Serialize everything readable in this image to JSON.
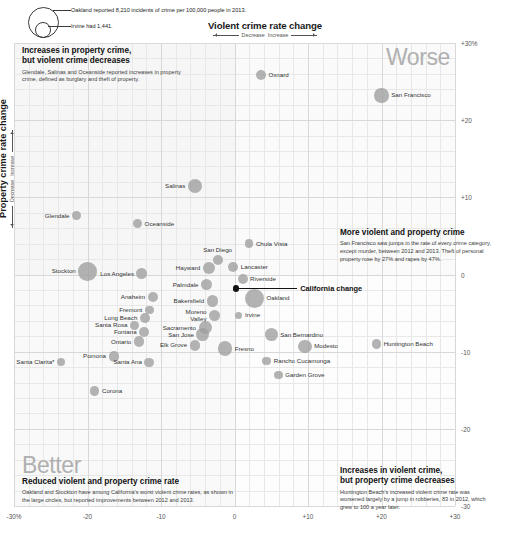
{
  "header": {
    "x_axis_title": "Violent crime rate change",
    "x_dir_left": "Decrease",
    "x_dir_right": "Increase",
    "y_axis_title": "Property crime rate change",
    "y_dir_up": "Increase",
    "y_dir_down": "Decrease"
  },
  "legend": {
    "line1": "Oakland reported 8,210 incidents of crime per 100,000 people in 2013.",
    "line2": "Irvine had 1,441."
  },
  "callout": {
    "label": "California change"
  },
  "corner_words": {
    "worse": "Worse",
    "better": "Better"
  },
  "annotations": [
    {
      "id": "top-left",
      "headline": "Increases in property crime,\nbut violent crime decreases",
      "headline_line1": "Increases in property crime,",
      "headline_line2": "but violent crime decreases",
      "body": "Glendale, Salinas and Oceanside reported increases in property crime, defined as burglary and theft of property."
    },
    {
      "id": "top-right",
      "headline_line1": "More violent and property crime",
      "headline_line2": "",
      "body": "San Francisco saw jumps in the rate of every crime category, except murder, between 2012 and 2013. Theft of personal property rose by 27% and rapes by 47%."
    },
    {
      "id": "bottom-left",
      "headline_line1": "Reduced violent and property crime rate",
      "headline_line2": "",
      "body": "Oakland and Stockton have among California's worst violent crime rates, as shown in the large circles, but reported improvements between 2012 and 2013."
    },
    {
      "id": "bottom-right",
      "headline_line1": "Increases in violent crime,",
      "headline_line2": "but property crime decreases",
      "body": "Huntington Beach's increased violent crime rate was worsened largely by a jump in robberies, 83 in 2012, which grew to 100 a year later."
    }
  ],
  "chart_data": {
    "type": "scatter",
    "xlabel": "Violent crime rate change",
    "ylabel": "Property crime rate change",
    "xlim": [
      -30,
      30
    ],
    "ylim": [
      -30,
      30
    ],
    "xticks": [
      "-30%",
      "-20",
      "-10",
      "0",
      "+10",
      "+20",
      "+30"
    ],
    "xtick_values": [
      -30,
      -20,
      -10,
      0,
      10,
      20,
      30
    ],
    "yticks": [
      "+30%",
      "+20",
      "+10",
      "0",
      "-10",
      "-20",
      "-30"
    ],
    "ytick_values": [
      30,
      20,
      10,
      0,
      -10,
      -20,
      -30
    ],
    "grid": true,
    "legend_position": "top-left",
    "size_encodes": "total crime incidents per 100,000 people in 2013",
    "points": [
      {
        "name": "Oxnard",
        "x": 3.6,
        "y": 25.8,
        "r": 5.0,
        "label_pos": "l"
      },
      {
        "name": "San Francisco",
        "x": 20.0,
        "y": 23.2,
        "r": 7.2,
        "label_pos": "l"
      },
      {
        "name": "Salinas",
        "x": -5.4,
        "y": 11.5,
        "r": 7.0,
        "label_pos": "r"
      },
      {
        "name": "Glendale",
        "x": -21.5,
        "y": 7.6,
        "r": 4.4,
        "label_pos": "r"
      },
      {
        "name": "Oceanside",
        "x": -13.2,
        "y": 6.6,
        "r": 4.6,
        "label_pos": "l"
      },
      {
        "name": "Chula Vista",
        "x": 2.0,
        "y": 4.0,
        "r": 4.2,
        "label_pos": "l"
      },
      {
        "name": "San Diego",
        "x": -2.3,
        "y": 1.9,
        "r": 5.0,
        "label_pos": "c_top"
      },
      {
        "name": "Hayward",
        "x": -3.5,
        "y": 0.9,
        "r": 6.0,
        "label_pos": "r"
      },
      {
        "name": "Lancaster",
        "x": -0.2,
        "y": 1.0,
        "r": 5.2,
        "label_pos": "l"
      },
      {
        "name": "Stockton",
        "x": -20.0,
        "y": 0.4,
        "r": 9.2,
        "label_pos": "r"
      },
      {
        "name": "Los Angeles",
        "x": -12.6,
        "y": 0.1,
        "r": 5.4,
        "label_pos": "r"
      },
      {
        "name": "Riverside",
        "x": 1.1,
        "y": -0.6,
        "r": 5.0,
        "label_pos": "l"
      },
      {
        "name": "Palmdale",
        "x": -3.8,
        "y": -1.3,
        "r": 5.6,
        "label_pos": "r"
      },
      {
        "name": "Anaheim",
        "x": -11.1,
        "y": -2.9,
        "r": 5.2,
        "label_pos": "r"
      },
      {
        "name": "Bakersfield",
        "x": -3.0,
        "y": -3.4,
        "r": 5.8,
        "label_pos": "r"
      },
      {
        "name": "Oakland",
        "x": 2.7,
        "y": -3.1,
        "r": 9.6,
        "label_pos": "l"
      },
      {
        "name": "Fremont",
        "x": -11.6,
        "y": -4.6,
        "r": 4.4,
        "label_pos": "r"
      },
      {
        "name": "Long Beach",
        "x": -12.2,
        "y": -5.6,
        "r": 5.0,
        "label_pos": "r"
      },
      {
        "name": "Moreno Valley",
        "x": -2.7,
        "y": -5.3,
        "r": 5.6,
        "label_pos": "r"
      },
      {
        "name": "Irvine",
        "x": 0.6,
        "y": -5.3,
        "r": 3.6,
        "label_pos": "l"
      },
      {
        "name": "Santa Rosa",
        "x": -13.6,
        "y": -6.6,
        "r": 4.6,
        "label_pos": "r"
      },
      {
        "name": "Sacramento",
        "x": -4.0,
        "y": -6.9,
        "r": 6.6,
        "label_pos": "r"
      },
      {
        "name": "Fontana",
        "x": -12.3,
        "y": -7.4,
        "r": 5.0,
        "label_pos": "r"
      },
      {
        "name": "San Jose",
        "x": -4.3,
        "y": -7.8,
        "r": 6.4,
        "label_pos": "r"
      },
      {
        "name": "San Bernardino",
        "x": 5.0,
        "y": -7.8,
        "r": 6.4,
        "label_pos": "l"
      },
      {
        "name": "Ontario",
        "x": -13.0,
        "y": -8.7,
        "r": 5.2,
        "label_pos": "r"
      },
      {
        "name": "Elk Grove",
        "x": -5.4,
        "y": -9.2,
        "r": 5.2,
        "label_pos": "r"
      },
      {
        "name": "Fresno",
        "x": -1.3,
        "y": -9.6,
        "r": 7.2,
        "label_pos": "l"
      },
      {
        "name": "Modesto",
        "x": 9.6,
        "y": -9.3,
        "r": 6.6,
        "label_pos": "l"
      },
      {
        "name": "Huntington Beach",
        "x": 19.3,
        "y": -9.0,
        "r": 4.8,
        "label_pos": "l"
      },
      {
        "name": "Pomona",
        "x": -16.4,
        "y": -10.6,
        "r": 5.4,
        "label_pos": "r"
      },
      {
        "name": "Santa Ana",
        "x": -11.6,
        "y": -11.4,
        "r": 4.8,
        "label_pos": "r"
      },
      {
        "name": "Rancho Cucamonga",
        "x": 4.4,
        "y": -11.2,
        "r": 4.4,
        "label_pos": "l"
      },
      {
        "name": "Santa Clarita*",
        "x": -23.6,
        "y": -11.4,
        "r": 4.0,
        "label_pos": "r"
      },
      {
        "name": "Garden Grove",
        "x": 6.0,
        "y": -13.0,
        "r": 4.2,
        "label_pos": "l"
      },
      {
        "name": "Corona",
        "x": -19.0,
        "y": -15.1,
        "r": 4.6,
        "label_pos": "l"
      }
    ],
    "reference_point": {
      "name": "California change",
      "x": 0.2,
      "y": -1.8,
      "r": 3.2
    }
  }
}
